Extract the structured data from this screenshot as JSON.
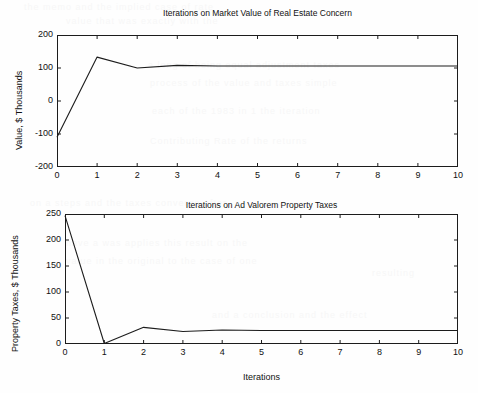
{
  "figure": {
    "background_color": "#fefefe",
    "line_color": "#1c1c1c",
    "axis_color": "#1c1c1c"
  },
  "ghost_text": [
    {
      "text": "the  memo  and  the  implied  case  of  rate",
      "x": 24,
      "y": 2
    },
    {
      "text": "value  that  was  exactly  with  the",
      "x": 66,
      "y": 16
    },
    {
      "text": "a  long  of  being  equal  adjustment  taxes",
      "x": 148,
      "y": 60
    },
    {
      "text": "process  of  the  value  and  taxes  simple",
      "x": 150,
      "y": 78
    },
    {
      "text": "each  of  the  1983  in  1  the  iteration",
      "x": 152,
      "y": 106
    },
    {
      "text": "Contributing  Rate  of  the  returns",
      "x": 150,
      "y": 136
    },
    {
      "text": "on  a  steps  and  the  taxes  converge  after",
      "x": 30,
      "y": 198
    },
    {
      "text": "have  a  was  applies  this  result  on  the",
      "x": 66,
      "y": 238
    },
    {
      "text": "value  in  the  original  to  the  case  of  one",
      "x": 66,
      "y": 256
    },
    {
      "text": "resulting",
      "x": 372,
      "y": 268
    },
    {
      "text": "and  a  conclusion  and  the  effect",
      "x": 212,
      "y": 310
    }
  ],
  "chart_data": [
    {
      "type": "line",
      "id": "market-value-chart",
      "title": "Iterations on Market Value of Real Estate Concern",
      "xlabel": "",
      "ylabel": "Value, $ Thousands",
      "xlim": [
        0,
        10
      ],
      "ylim": [
        -200,
        200
      ],
      "grid": false,
      "legend": false,
      "xticks": [
        0,
        1,
        2,
        3,
        4,
        5,
        6,
        7,
        8,
        9,
        10
      ],
      "xtick_labels": [
        "0",
        "1",
        "2",
        "3",
        "4",
        "5",
        "6",
        "7",
        "8",
        "9",
        "10"
      ],
      "yticks": [
        -200,
        -100,
        0,
        100,
        200
      ],
      "ytick_labels": [
        "-200",
        "-100",
        "0",
        "100",
        "200"
      ],
      "x": [
        0,
        1,
        2,
        3,
        4,
        5,
        6,
        7,
        8,
        9,
        10
      ],
      "values": [
        -110,
        133,
        100,
        108,
        106,
        106,
        106,
        106,
        106,
        106,
        106
      ]
    },
    {
      "type": "line",
      "id": "property-taxes-chart",
      "title": "Iterations on Ad Valorem Property Taxes",
      "xlabel": "Iterations",
      "ylabel": "Property Taxes, $ Thousands",
      "xlim": [
        0,
        10
      ],
      "ylim": [
        0,
        250
      ],
      "grid": false,
      "legend": false,
      "xticks": [
        0,
        1,
        2,
        3,
        4,
        5,
        6,
        7,
        8,
        9,
        10
      ],
      "xtick_labels": [
        "0",
        "1",
        "2",
        "3",
        "4",
        "5",
        "6",
        "7",
        "8",
        "9",
        "10"
      ],
      "yticks": [
        0,
        50,
        100,
        150,
        200,
        250
      ],
      "ytick_labels": [
        "0",
        "50",
        "100",
        "150",
        "200",
        "250"
      ],
      "x": [
        0,
        1,
        2,
        3,
        4,
        5,
        6,
        7,
        8,
        9,
        10
      ],
      "values": [
        247,
        1,
        32,
        24,
        27,
        26,
        26,
        26,
        26,
        26,
        26
      ]
    }
  ]
}
